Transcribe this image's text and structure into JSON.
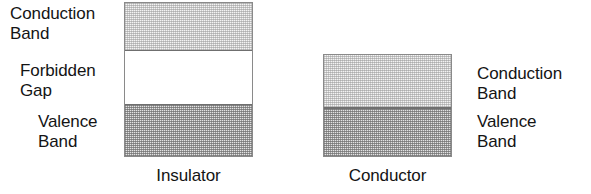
{
  "figure": {
    "colors": {
      "band_outline": "#8a8a8a",
      "band_divider": "#6f6f6f",
      "conduction_fill": "#f3f3f3",
      "valence_fill": "#e2e2e2",
      "gap_fill": "#ffffff",
      "text": "#141414",
      "background": "#ffffff"
    }
  },
  "insulator": {
    "caption": "Insulator",
    "labels": {
      "conduction_band": "Conduction\nBand",
      "forbidden_gap": "Forbidden\nGap",
      "valence_band": "Valence\nBand"
    },
    "bands": [
      {
        "name": "conduction-band",
        "label": "Conduction Band",
        "fill": "light-stipple"
      },
      {
        "name": "forbidden-gap",
        "label": "Forbidden Gap",
        "fill": "none"
      },
      {
        "name": "valence-band",
        "label": "Valence Band",
        "fill": "dark-stipple"
      }
    ]
  },
  "conductor": {
    "caption": "Conductor",
    "labels": {
      "conduction_band": "Conduction\nBand",
      "valence_band": "Valence\nBand"
    },
    "bands": [
      {
        "name": "conduction-band",
        "label": "Conduction Band",
        "fill": "light-stipple"
      },
      {
        "name": "valence-band",
        "label": "Valence Band",
        "fill": "dark-stipple"
      }
    ]
  },
  "chart_data": {
    "type": "diagram",
    "ylabel": "Energy",
    "panels": [
      {
        "name": "Insulator",
        "caption": "Insulator",
        "bands": [
          {
            "label": "Conduction Band",
            "shading": "light",
            "order": 1
          },
          {
            "label": "Forbidden Gap",
            "shading": "empty",
            "order": 2
          },
          {
            "label": "Valence Band",
            "shading": "dark",
            "order": 3
          }
        ],
        "has_gap": true
      },
      {
        "name": "Conductor",
        "caption": "Conductor",
        "bands": [
          {
            "label": "Conduction Band",
            "shading": "light",
            "order": 1
          },
          {
            "label": "Valence Band",
            "shading": "dark",
            "order": 2
          }
        ],
        "has_gap": false
      }
    ]
  }
}
